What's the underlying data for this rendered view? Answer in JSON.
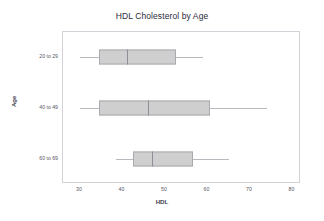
{
  "chart_data": {
    "type": "box",
    "title": "HDL Cholesterol by Age",
    "xlabel": "HDL",
    "ylabel": "Age",
    "orientation": "horizontal",
    "xlim": [
      26,
      82
    ],
    "xticks": [
      30,
      40,
      50,
      60,
      70,
      80
    ],
    "xtick_labels": [
      "30",
      "40",
      "50",
      "60",
      "70",
      "80"
    ],
    "categories": [
      "20 to 29",
      "40 to 49",
      "60 to 69"
    ],
    "grid": false,
    "legend": false,
    "box_fill_color": "#cfcfcf",
    "box_edge_color": "#a9a9b0",
    "whisker_color": "#b9b9c0",
    "median_color": "#8e8e96",
    "boxes": [
      {
        "category": "20 to 29",
        "whisker_low": 30.0,
        "q1": 34.5,
        "median": 41.0,
        "q3": 52.5,
        "whisker_high": 59.0
      },
      {
        "category": "40 to 49",
        "whisker_low": 30.0,
        "q1": 34.5,
        "median": 46.0,
        "q3": 60.5,
        "whisker_high": 74.0
      },
      {
        "category": "60 to 69",
        "whisker_low": 38.5,
        "q1": 42.5,
        "median": 47.0,
        "q3": 56.5,
        "whisker_high": 65.0
      }
    ]
  }
}
